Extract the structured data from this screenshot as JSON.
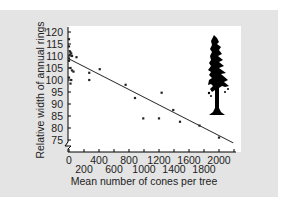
{
  "chart_data": {
    "type": "scatter",
    "title": "",
    "xlabel": "Mean number of cones per tree",
    "ylabel": "Relative width of annual rings",
    "xlim": [
      0,
      2200
    ],
    "ylim": [
      75,
      120
    ],
    "y_axis_break": true,
    "grid": false,
    "legend": null,
    "x_ticks": [
      0,
      200,
      400,
      600,
      800,
      1000,
      1200,
      1400,
      1600,
      1800,
      2000,
      2200
    ],
    "x_tick_labels_row1": [
      "0",
      "400",
      "800",
      "1200",
      "1600",
      "2000"
    ],
    "x_tick_labels_row2": [
      "200",
      "600",
      "1000",
      "1400",
      "1800"
    ],
    "y_ticks": [
      75,
      80,
      85,
      90,
      95,
      100,
      105,
      110,
      115,
      120
    ],
    "y_tick_labels": [
      "75",
      "80",
      "85",
      "90",
      "95",
      "100",
      "105",
      "110",
      "115",
      "120"
    ],
    "series": [
      {
        "name": "Trees",
        "points": [
          {
            "x": 0,
            "y": 117
          },
          {
            "x": 0,
            "y": 114
          },
          {
            "x": 10,
            "y": 112
          },
          {
            "x": 20,
            "y": 111.5
          },
          {
            "x": 30,
            "y": 111
          },
          {
            "x": 10,
            "y": 110.5
          },
          {
            "x": 40,
            "y": 110
          },
          {
            "x": 0,
            "y": 109
          },
          {
            "x": 100,
            "y": 109.5
          },
          {
            "x": 0,
            "y": 108
          },
          {
            "x": 20,
            "y": 105
          },
          {
            "x": 40,
            "y": 104
          },
          {
            "x": 60,
            "y": 103.5
          },
          {
            "x": 0,
            "y": 101
          },
          {
            "x": 30,
            "y": 100
          },
          {
            "x": 20,
            "y": 98.5
          },
          {
            "x": 270,
            "y": 103
          },
          {
            "x": 270,
            "y": 100
          },
          {
            "x": 410,
            "y": 104.5
          },
          {
            "x": 755,
            "y": 98
          },
          {
            "x": 880,
            "y": 92.5
          },
          {
            "x": 990,
            "y": 84
          },
          {
            "x": 1200,
            "y": 84
          },
          {
            "x": 1235,
            "y": 94.7
          },
          {
            "x": 1390,
            "y": 87.5
          },
          {
            "x": 1480,
            "y": 82.6
          },
          {
            "x": 1740,
            "y": 81
          },
          {
            "x": 2000,
            "y": 76
          }
        ]
      }
    ],
    "trendline": {
      "x": [
        0,
        2190
      ],
      "y": [
        108.8,
        73.8
      ]
    },
    "annotations": [
      {
        "type": "image",
        "description": "tree silhouette (conifer)",
        "position": "top-right"
      }
    ]
  }
}
